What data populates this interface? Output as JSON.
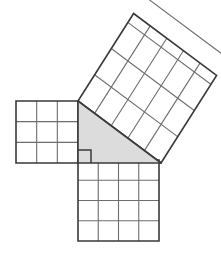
{
  "figure": {
    "background_color": "#ffffff",
    "edge_color": "#3a3a3a",
    "grid_color": "#6e6e6e",
    "triangle_fill_color": "#dcdcdc",
    "square_fill_color": "#ffffff",
    "unit_px": 20.75
  },
  "triangle": {
    "name": "right-triangle",
    "fill": "#dcdcdc",
    "vertices": [
      {
        "label": "A",
        "x": 78,
        "y": 101
      },
      {
        "label": "B",
        "x": 78,
        "y": 163
      },
      {
        "label": "C",
        "x": 161,
        "y": 163
      }
    ],
    "points_attr": "78,101 78,163 161,163",
    "right_angle_vertex": "B",
    "right_angle_marker": {
      "name": "right-angle-marker",
      "points_attr": "78,150 91,150 91,163",
      "size_px": 13
    },
    "side_lengths_units": {
      "vertical_leg": 3,
      "horizontal_leg": 4,
      "hypotenuse": 5
    }
  },
  "squares": [
    {
      "name": "square-on-vertical-leg",
      "position": "left",
      "side_units": 3,
      "area_units": 9,
      "side_px": 62,
      "rows": 3,
      "cols": 3,
      "cells": 9,
      "origin": {
        "x": 16,
        "y": 101
      },
      "outline_points": "16,101 78,101 78,163 16,163",
      "grid_lines": [
        "36.67,101 36.67,163",
        "57.33,101 57.33,163",
        "16,121.67 78,121.67",
        "16,142.33 78,142.33"
      ]
    },
    {
      "name": "square-on-horizontal-leg",
      "position": "bottom",
      "side_units": 4,
      "area_units": 16,
      "side_px": 81,
      "rows": 4,
      "cols": 4,
      "cells": 16,
      "origin": {
        "x": 78,
        "y": 160
      },
      "outline_points": "78,160 159,160 159,241 78,241",
      "grid_lines": [
        "98.25,160 98.25,241",
        "118.5,160 118.5,241",
        "138.75,160 138.75,241",
        "78,180.25 159,180.25",
        "78,200.5 159,200.5",
        "78,220.75 159,220.75"
      ]
    },
    {
      "name": "square-on-hypotenuse",
      "position": "tilted-upper-right",
      "side_units": 5,
      "area_units": 25,
      "side_px": 103.6,
      "rows": 5,
      "cols": 5,
      "cells": 25,
      "rotation_deg": -36.7,
      "corners": [
        {
          "label": "bottom-left",
          "x": 78,
          "y": 101
        },
        {
          "label": "top-left",
          "x": 133.6,
          "y": 13.5
        },
        {
          "label": "top-right",
          "x": 216.6,
          "y": 75.4
        },
        {
          "label": "bottom-right",
          "x": 161,
          "y": 163
        }
      ],
      "outline_points": "78,101 133.6,13.5 216.6,75.4 161,163"
    }
  ]
}
